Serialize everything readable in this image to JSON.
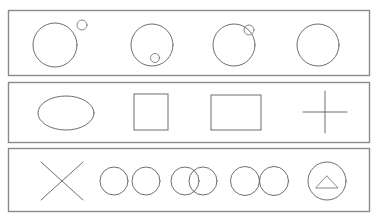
{
  "figure": {
    "background_color": "#ffffff",
    "panel_border_color": "#8a8a8a",
    "shape_stroke_color": "#5e5e63",
    "width": 380,
    "height": 223,
    "row_count": 3
  },
  "rows": [
    {
      "id": "row-1",
      "name": "circle-and-small-circle-relations",
      "frame": {
        "x": 8,
        "y": 10,
        "width": 362,
        "height": 66
      },
      "cells": [
        {
          "id": "cell-1-1",
          "name": "large-circle-with-external-small-circle",
          "primary": {
            "type": "circle",
            "cx": 55,
            "cy": 45,
            "r": 22
          },
          "secondary": {
            "type": "circle",
            "cx": 82,
            "cy": 25,
            "r": 5
          },
          "relation": "disjoint-external"
        },
        {
          "id": "cell-1-2",
          "name": "large-circle-with-internal-small-circle",
          "primary": {
            "type": "circle",
            "cx": 152,
            "cy": 45,
            "r": 21
          },
          "secondary": {
            "type": "circle",
            "cx": 155,
            "cy": 58,
            "r": 4.5
          },
          "relation": "contained-inside"
        },
        {
          "id": "cell-1-3",
          "name": "large-circle-with-small-circle-on-boundary",
          "primary": {
            "type": "circle",
            "cx": 234,
            "cy": 45,
            "r": 21
          },
          "secondary": {
            "type": "circle",
            "cx": 249,
            "cy": 30,
            "r": 5
          },
          "relation": "overlapping-boundary"
        },
        {
          "id": "cell-1-4",
          "name": "plain-large-circle",
          "primary": {
            "type": "circle",
            "cx": 318,
            "cy": 45,
            "r": 21
          },
          "secondary": null,
          "relation": "none"
        }
      ]
    },
    {
      "id": "row-2",
      "name": "basic-outline-shapes",
      "frame": {
        "x": 8,
        "y": 82,
        "width": 362,
        "height": 61
      },
      "cells": [
        {
          "id": "cell-2-1",
          "name": "ellipse",
          "primary": {
            "type": "ellipse",
            "cx": 66,
            "cy": 113,
            "rx": 28,
            "ry": 17
          },
          "secondary": null,
          "relation": "none"
        },
        {
          "id": "cell-2-2",
          "name": "square",
          "primary": {
            "type": "rect",
            "x": 134,
            "y": 94,
            "width": 34,
            "height": 36
          },
          "secondary": null,
          "relation": "none"
        },
        {
          "id": "cell-2-3",
          "name": "rectangle",
          "primary": {
            "type": "rect",
            "x": 211,
            "y": 95,
            "width": 50,
            "height": 35
          },
          "secondary": null,
          "relation": "none"
        },
        {
          "id": "cell-2-4",
          "name": "plus-cross",
          "primary": {
            "type": "cross",
            "cx": 325,
            "cy": 112,
            "half_width": 22,
            "half_height": 21
          },
          "secondary": null,
          "relation": "none"
        }
      ]
    },
    {
      "id": "row-3",
      "name": "pair-and-composite-shapes",
      "frame": {
        "x": 8,
        "y": 148,
        "width": 362,
        "height": 64
      },
      "cells": [
        {
          "id": "cell-3-1",
          "name": "x-cross-mark",
          "primary": {
            "type": "x-mark",
            "cx": 62,
            "cy": 181,
            "half_width": 21,
            "half_height": 19
          },
          "secondary": null,
          "relation": "none"
        },
        {
          "id": "cell-3-2",
          "name": "two-separate-circles",
          "primary": {
            "type": "circle",
            "cx": 114,
            "cy": 181,
            "r": 14
          },
          "secondary": {
            "type": "circle",
            "cx": 146,
            "cy": 181,
            "r": 14
          },
          "relation": "disjoint"
        },
        {
          "id": "cell-3-3",
          "name": "two-overlapping-circles",
          "primary": {
            "type": "circle",
            "cx": 185,
            "cy": 181,
            "r": 14
          },
          "secondary": {
            "type": "circle",
            "cx": 203,
            "cy": 181,
            "r": 14
          },
          "relation": "overlapping"
        },
        {
          "id": "cell-3-4",
          "name": "two-tangent-circles",
          "primary": {
            "type": "circle",
            "cx": 245,
            "cy": 181,
            "r": 14.5
          },
          "secondary": {
            "type": "circle",
            "cx": 274,
            "cy": 181,
            "r": 14.5
          },
          "relation": "tangent"
        },
        {
          "id": "cell-3-5",
          "name": "circle-containing-triangle",
          "primary": {
            "type": "circle",
            "cx": 327,
            "cy": 181,
            "r": 19
          },
          "secondary": {
            "type": "triangle",
            "cx": 327,
            "cy": 182,
            "half_width": 11,
            "height": 12
          },
          "relation": "contained-inside"
        }
      ]
    }
  ]
}
